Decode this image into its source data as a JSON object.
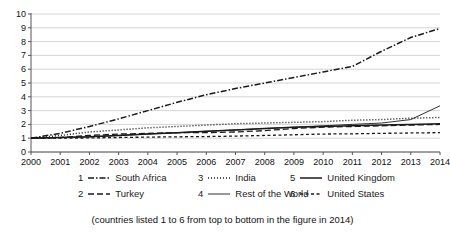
{
  "chart_data": {
    "type": "line",
    "title": "",
    "xlabel": "",
    "ylabel": "",
    "x": [
      2000,
      2001,
      2002,
      2003,
      2004,
      2005,
      2006,
      2007,
      2008,
      2009,
      2010,
      2011,
      2012,
      2013,
      2014
    ],
    "xlim": [
      2000,
      2014
    ],
    "ylim": [
      0,
      10
    ],
    "yticks": [
      0,
      1,
      2,
      3,
      4,
      5,
      6,
      7,
      8,
      9,
      10
    ],
    "xticks": [
      "2000",
      "2001",
      "2002",
      "2003",
      "2004",
      "2005",
      "2006",
      "2007",
      "2008",
      "2009",
      "2010",
      "2011",
      "2012",
      "2013",
      "2014"
    ],
    "grid": "horizontal",
    "legend_position": "bottom",
    "series": [
      {
        "rank": "1",
        "name": "South Africa",
        "style": "dash-dot",
        "values": [
          1.0,
          1.35,
          1.85,
          2.4,
          3.0,
          3.6,
          4.15,
          4.6,
          5.0,
          5.4,
          5.8,
          6.2,
          7.3,
          8.3,
          8.95
        ]
      },
      {
        "rank": "2",
        "name": "Turkey",
        "style": "long-dash",
        "values": [
          1.0,
          1.05,
          1.2,
          1.3,
          1.35,
          1.4,
          1.4,
          1.45,
          1.55,
          1.7,
          1.8,
          1.85,
          1.9,
          1.95,
          2.0
        ]
      },
      {
        "rank": "3",
        "name": "India",
        "style": "dotted",
        "values": [
          1.0,
          1.2,
          1.45,
          1.6,
          1.75,
          1.85,
          1.95,
          2.05,
          2.1,
          2.15,
          2.2,
          2.3,
          2.35,
          2.45,
          2.5
        ]
      },
      {
        "rank": "4",
        "name": "Rest of the World",
        "style": "solid-thin",
        "values": [
          1.0,
          1.05,
          1.1,
          1.2,
          1.3,
          1.4,
          1.5,
          1.6,
          1.7,
          1.8,
          1.9,
          2.0,
          2.1,
          2.35,
          3.35
        ]
      },
      {
        "rank": "5",
        "name": "United Kingdom",
        "style": "solid",
        "values": [
          1.0,
          1.05,
          1.1,
          1.2,
          1.3,
          1.4,
          1.5,
          1.6,
          1.7,
          1.8,
          1.85,
          1.9,
          1.95,
          2.0,
          2.05
        ]
      },
      {
        "rank": "6",
        "name": "United States",
        "style": "short-dash",
        "values": [
          1.0,
          1.0,
          1.02,
          1.05,
          1.08,
          1.1,
          1.12,
          1.15,
          1.2,
          1.25,
          1.3,
          1.32,
          1.35,
          1.38,
          1.4
        ]
      }
    ]
  },
  "legend": {
    "rows": [
      [
        {
          "num": "1",
          "label": "South Africa",
          "style": "dash-dot"
        },
        {
          "num": "3",
          "label": "India",
          "style": "dotted"
        },
        {
          "num": "5",
          "label": "United Kingdom",
          "style": "solid"
        }
      ],
      [
        {
          "num": "2",
          "label": "Turkey",
          "style": "long-dash"
        },
        {
          "num": "4",
          "label": "Rest of the World",
          "style": "solid-thin"
        },
        {
          "num": "6",
          "label": "United States",
          "style": "short-dash"
        }
      ]
    ]
  },
  "caption": {
    "text": "(countries listed 1 to 6 from top to bottom in the figure in 2014)"
  },
  "colors": {
    "line": "#1a1a1a",
    "grid": "#c9c9c9",
    "axis": "#555555",
    "background": "#ffffff"
  }
}
